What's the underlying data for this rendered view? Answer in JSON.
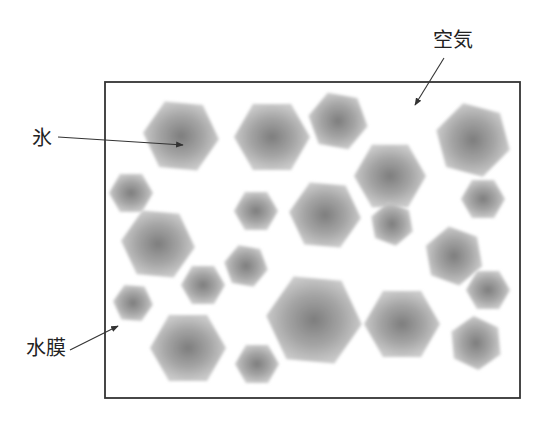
{
  "diagram": {
    "box": {
      "x": 105,
      "y": 82,
      "width": 415,
      "height": 316,
      "stroke": "#333333"
    },
    "colors": {
      "crystal_center": "#7d7d7d",
      "crystal_mid": "#a6a6a6",
      "crystal_edge": "#c9c9c9",
      "arrow": "#333333",
      "text": "#222222"
    },
    "labels": [
      {
        "id": "ice",
        "text": "氷",
        "x": 32,
        "y": 128,
        "arrow": {
          "x1": 58,
          "y1": 137,
          "x2": 183,
          "y2": 145
        }
      },
      {
        "id": "air",
        "text": "空気",
        "x": 433,
        "y": 30,
        "arrow": {
          "x1": 444,
          "y1": 58,
          "x2": 415,
          "y2": 105
        }
      },
      {
        "id": "water-film",
        "text": "水膜",
        "x": 26,
        "y": 338,
        "arrow": {
          "x1": 70,
          "y1": 350,
          "x2": 118,
          "y2": 326
        }
      }
    ],
    "crystals": [
      {
        "cx": 181,
        "cy": 136,
        "r": 38,
        "rot": 5
      },
      {
        "cx": 272,
        "cy": 137,
        "r": 38,
        "rot": 0
      },
      {
        "cx": 338,
        "cy": 121,
        "r": 30,
        "rot": 10
      },
      {
        "cx": 473,
        "cy": 140,
        "r": 38,
        "rot": 15
      },
      {
        "cx": 390,
        "cy": 176,
        "r": 36,
        "rot": 0
      },
      {
        "cx": 131,
        "cy": 193,
        "r": 22,
        "rot": 0
      },
      {
        "cx": 256,
        "cy": 211,
        "r": 22,
        "rot": 0
      },
      {
        "cx": 325,
        "cy": 215,
        "r": 36,
        "rot": 5
      },
      {
        "cx": 483,
        "cy": 199,
        "r": 22,
        "rot": 0
      },
      {
        "cx": 392,
        "cy": 224,
        "r": 22,
        "rot": 20
      },
      {
        "cx": 158,
        "cy": 244,
        "r": 37,
        "rot": 5
      },
      {
        "cx": 246,
        "cy": 266,
        "r": 22,
        "rot": 10
      },
      {
        "cx": 454,
        "cy": 256,
        "r": 30,
        "rot": 20
      },
      {
        "cx": 203,
        "cy": 285,
        "r": 22,
        "rot": 0
      },
      {
        "cx": 488,
        "cy": 290,
        "r": 22,
        "rot": 0
      },
      {
        "cx": 133,
        "cy": 303,
        "r": 20,
        "rot": 5
      },
      {
        "cx": 314,
        "cy": 320,
        "r": 48,
        "rot": 5
      },
      {
        "cx": 402,
        "cy": 324,
        "r": 38,
        "rot": 0
      },
      {
        "cx": 476,
        "cy": 343,
        "r": 27,
        "rot": 25
      },
      {
        "cx": 188,
        "cy": 348,
        "r": 38,
        "rot": 0
      },
      {
        "cx": 257,
        "cy": 364,
        "r": 22,
        "rot": 0
      }
    ]
  }
}
